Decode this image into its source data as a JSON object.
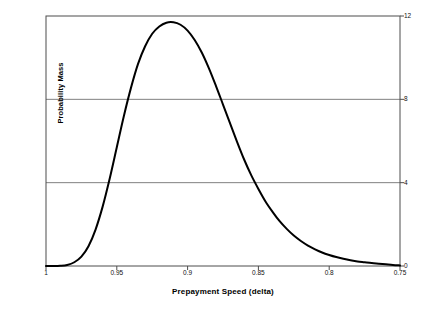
{
  "chart_data": {
    "type": "line",
    "title": "",
    "xlabel": "Prepayment Speed (delta)",
    "ylabel": "Probability Mass",
    "xlim": [
      1.0,
      0.75
    ],
    "ylim": [
      0,
      12
    ],
    "x_reversed": true,
    "grid": "horizontal",
    "gridlines_y": [
      4,
      8
    ],
    "legend": "none",
    "xticks": [
      "1",
      "0.95",
      "0.9",
      "0.85",
      "0.8",
      "0.75"
    ],
    "xtick_values": [
      1.0,
      0.95,
      0.9,
      0.85,
      0.8,
      0.75
    ],
    "yticks": [
      "0",
      "4",
      "8",
      "12"
    ],
    "ytick_values": [
      0,
      4,
      8,
      12
    ],
    "ytick_side": "right",
    "series": [
      {
        "name": "Probability Mass",
        "color": "#000000",
        "x": [
          1.0,
          0.995,
          0.99,
          0.985,
          0.98,
          0.975,
          0.97,
          0.965,
          0.96,
          0.955,
          0.95,
          0.945,
          0.94,
          0.935,
          0.93,
          0.925,
          0.92,
          0.915,
          0.91,
          0.905,
          0.9,
          0.895,
          0.89,
          0.885,
          0.88,
          0.875,
          0.87,
          0.865,
          0.86,
          0.855,
          0.85,
          0.845,
          0.84,
          0.835,
          0.83,
          0.825,
          0.82,
          0.815,
          0.81,
          0.805,
          0.8,
          0.795,
          0.79,
          0.785,
          0.78,
          0.775,
          0.77,
          0.765,
          0.76,
          0.755,
          0.75
        ],
        "y": [
          0.0,
          0.0,
          0.01,
          0.05,
          0.18,
          0.45,
          0.95,
          1.75,
          2.85,
          4.2,
          5.7,
          7.2,
          8.55,
          9.7,
          10.55,
          11.15,
          11.5,
          11.68,
          11.7,
          11.58,
          11.3,
          10.85,
          10.25,
          9.5,
          8.65,
          7.75,
          6.85,
          5.95,
          5.1,
          4.35,
          3.7,
          3.1,
          2.6,
          2.15,
          1.78,
          1.46,
          1.2,
          0.98,
          0.8,
          0.65,
          0.53,
          0.43,
          0.35,
          0.28,
          0.22,
          0.18,
          0.14,
          0.11,
          0.08,
          0.05,
          0.03
        ],
        "peak_x": 0.91,
        "peak_y": 11.7
      }
    ],
    "annotations": []
  },
  "axes": {
    "frame_color": "#4d4d4d",
    "gridline_color": "#808080",
    "curve_color": "#000000",
    "background": "#ffffff"
  }
}
